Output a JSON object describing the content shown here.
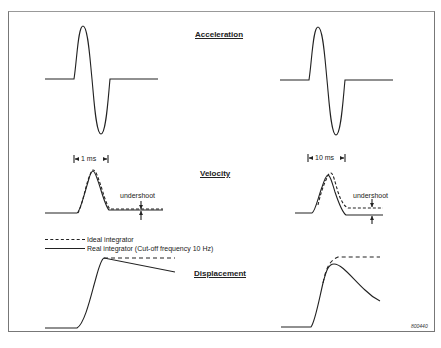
{
  "diagram": {
    "section_labels": {
      "acceleration": "Acceleration",
      "velocity": "Velocity",
      "displacement": "Displacement"
    },
    "time_markers": {
      "left": "1 ms",
      "right": "10 ms"
    },
    "annotations": {
      "undershoot_left": "undershoot",
      "undershoot_right": "undershoot"
    },
    "legend": {
      "ideal": "Ideal integrator",
      "real": "Real integrator (Cut-off frequency 10 Hz)"
    },
    "figure_code": "800440",
    "colors": {
      "line": "#222222",
      "frame": "#777777",
      "background": "#ffffff"
    }
  }
}
